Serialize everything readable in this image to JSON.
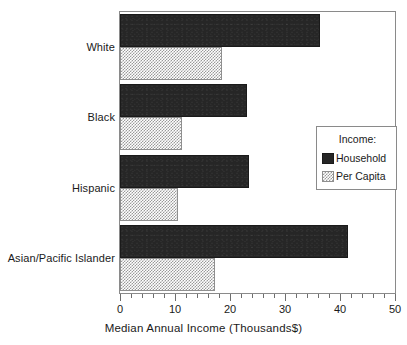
{
  "chart_data": {
    "type": "bar",
    "orientation": "horizontal",
    "title": "",
    "xlabel": "Median Annual Income (Thousands$)",
    "ylabel": "",
    "xlim": [
      0,
      50
    ],
    "xticks": [
      0,
      10,
      20,
      30,
      40,
      50
    ],
    "xtick_labels": [
      "0",
      "10",
      "20",
      "30",
      "40",
      "50"
    ],
    "minor_tick_interval": 2,
    "grid": false,
    "legend_title": "Income:",
    "legend_position": "right-center",
    "categories": [
      "White",
      "Black",
      "Hispanic",
      "Asian/Pacific Islander"
    ],
    "series": [
      {
        "name": "Household",
        "color": "#262626",
        "fill": "solid-dark",
        "values": [
          36.4,
          23.0,
          23.5,
          41.5
        ]
      },
      {
        "name": "Per Capita",
        "color": "#9a9a9a",
        "fill": "checkered-gray",
        "values": [
          18.5,
          11.3,
          10.5,
          17.3
        ]
      }
    ]
  },
  "legend": {
    "title": "Income:",
    "entries": [
      {
        "label": "Household",
        "swatch": "household-swatch"
      },
      {
        "label": "Per Capita",
        "swatch": "per-capita-swatch"
      }
    ]
  },
  "axis": {
    "x_title": "Median Annual Income (Thousands$)",
    "tick_labels": [
      "0",
      "10",
      "20",
      "30",
      "40",
      "50"
    ]
  },
  "categories": [
    {
      "label": "White"
    },
    {
      "label": "Black"
    },
    {
      "label": "Hispanic"
    },
    {
      "label": "Asian/Pacific Islander"
    }
  ]
}
